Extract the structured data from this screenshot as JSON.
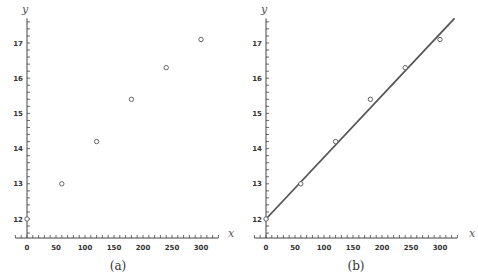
{
  "chart_data": [
    {
      "type": "scatter",
      "caption": "(a)",
      "xlabel": "x",
      "ylabel": "y",
      "x": [
        0,
        60,
        120,
        180,
        240,
        300
      ],
      "y": [
        12.0,
        13.0,
        14.2,
        15.4,
        16.3,
        17.1
      ],
      "xticks": [
        0,
        50,
        100,
        150,
        200,
        250,
        300
      ],
      "yticks": [
        12,
        13,
        14,
        15,
        16,
        17
      ],
      "xlim": [
        -20,
        330
      ],
      "ylim": [
        11.45,
        17.7
      ],
      "grid": false,
      "marker": "open-circle"
    },
    {
      "type": "scatter+line",
      "caption": "(b)",
      "xlabel": "x",
      "ylabel": "y",
      "x": [
        0,
        60,
        120,
        180,
        240,
        300
      ],
      "y": [
        12.0,
        13.0,
        14.2,
        15.4,
        16.3,
        17.1
      ],
      "fit_line": {
        "x": [
          0,
          325
        ],
        "y": [
          12.0,
          17.7
        ]
      },
      "xticks": [
        0,
        50,
        100,
        150,
        200,
        250,
        300
      ],
      "yticks": [
        12,
        13,
        14,
        15,
        16,
        17
      ],
      "xlim": [
        -20,
        330
      ],
      "ylim": [
        11.45,
        17.7
      ],
      "grid": false,
      "marker": "open-circle"
    }
  ]
}
